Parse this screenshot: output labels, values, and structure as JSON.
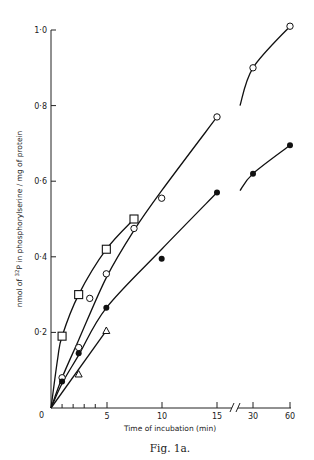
{
  "chart_data": {
    "type": "line",
    "title": "",
    "caption": "Fig. 1a.",
    "xlabel": "Time of incubation (min)",
    "ylabel_parts": {
      "prefix": "nmol of ",
      "superscript": "32",
      "suffix": "P in phosphorylserine / mg of protein"
    },
    "ylabel": "nmol of 32P in phosphorylserine / mg of protein",
    "x_ticks": [
      "0",
      "5",
      "10",
      "15",
      "30",
      "60"
    ],
    "x_axis_break": "between 15 and 30",
    "y_ticks": [
      "0",
      "0·2",
      "0·4",
      "0·6",
      "0·8",
      "1·0"
    ],
    "ylim": [
      0,
      1.0
    ],
    "grid": false,
    "legend": "none",
    "series": [
      {
        "name": "open squares",
        "marker": "square-open",
        "x": [
          1,
          2.5,
          5,
          7.5
        ],
        "y": [
          0.19,
          0.3,
          0.42,
          0.5
        ]
      },
      {
        "name": "open circles",
        "marker": "circle-open",
        "x": [
          1,
          2.5,
          3.5,
          5,
          7.5,
          10,
          15,
          30,
          60
        ],
        "y": [
          0.08,
          0.16,
          0.29,
          0.355,
          0.475,
          0.555,
          0.77,
          0.9,
          1.01
        ]
      },
      {
        "name": "filled circles",
        "marker": "circle-filled",
        "x": [
          1,
          2.5,
          5,
          10,
          15,
          30,
          60
        ],
        "y": [
          0.07,
          0.145,
          0.265,
          0.395,
          0.57,
          0.62,
          0.695
        ]
      },
      {
        "name": "open triangles",
        "marker": "triangle-open",
        "x": [
          2.5,
          5
        ],
        "y": [
          0.09,
          0.205
        ]
      }
    ]
  }
}
